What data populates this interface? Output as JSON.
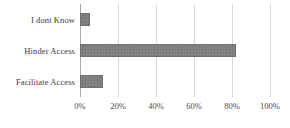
{
  "chart_data": {
    "type": "bar",
    "orientation": "horizontal",
    "title": "",
    "xlabel": "",
    "ylabel": "",
    "categories": [
      "Facilitate Access",
      "Hinder Access",
      "I dont Know"
    ],
    "values": [
      12,
      82,
      5
    ],
    "value_unit": "%",
    "xlim": [
      0,
      100
    ],
    "xticks": [
      0,
      20,
      40,
      60,
      80,
      100
    ],
    "xtick_labels": [
      "0%",
      "20%",
      "40%",
      "60%",
      "80%",
      "100%"
    ],
    "grid": true,
    "grid_axis": "x",
    "legend": false,
    "legend_position": "none",
    "series": [
      {
        "name": "",
        "values": [
          12,
          82,
          5
        ]
      }
    ],
    "bars": [
      {
        "category": "I dont Know",
        "value": 5,
        "label": "I dont Know"
      },
      {
        "category": "Hinder Access",
        "value": 82,
        "label": "Hinder Access"
      },
      {
        "category": "Facilitate Access",
        "value": 12,
        "label": "Facilitate Access"
      }
    ],
    "colors": {
      "bar_fill": "#808080",
      "bar_edge": "#707070",
      "gridline": "#d8d8d8",
      "axis_line": "#a8a8a8",
      "text": "#3a3a3a",
      "background": "#ffffff"
    }
  }
}
